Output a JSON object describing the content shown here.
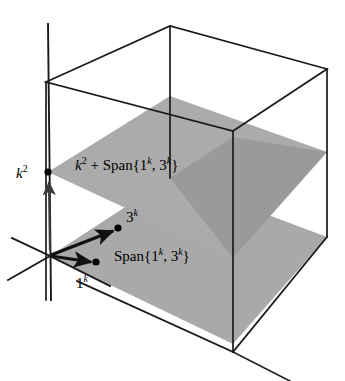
{
  "figure": {
    "background_color": "#ffffff",
    "line_color": "#1a1a1a",
    "plane_fill_color": "#a9a9a9",
    "plane_overlap_color": "#8d8d8d"
  },
  "labels": {
    "upper_plane": {
      "text": "k² + Span{1ᵏ, 3ᵏ}",
      "base_1": "k",
      "exp_1": "2",
      "connector": " + Span{1",
      "exp_2": "k",
      "middle": ", 3",
      "exp_3": "k",
      "close": "}"
    },
    "lower_plane": {
      "text": "Span{1ᵏ, 3ᵏ}",
      "lead": "Span{1",
      "exp_1": "k",
      "middle": ", 3",
      "exp_2": "k",
      "close": "}"
    },
    "axis_point": {
      "text": "k²",
      "base": "k",
      "exp": "2"
    },
    "vector_3k": {
      "text": "3ᵏ",
      "base": "3",
      "exp": "k"
    },
    "vector_1k": {
      "text": "1ᵏ",
      "base": "1",
      "exp": "k"
    }
  },
  "points": {
    "origin": {
      "x": 50,
      "y": 256
    },
    "k2": {
      "x": 48,
      "y": 172
    },
    "v3k": {
      "x": 118,
      "y": 228
    },
    "v1k": {
      "x": 96,
      "y": 262
    }
  },
  "geometry": {
    "box_top_face": "46,82 170,26 327,69 233,131",
    "box_bottom_front_corner": "233,352",
    "box_right_mid_corner": "327,237",
    "lower_plane": "50,256 170,178 327,237 233,344",
    "upper_plane": "48,172 170,96 327,152 233,258",
    "vertical_axis_top": "46,24",
    "vertical_axis_bottom": "52,300"
  }
}
